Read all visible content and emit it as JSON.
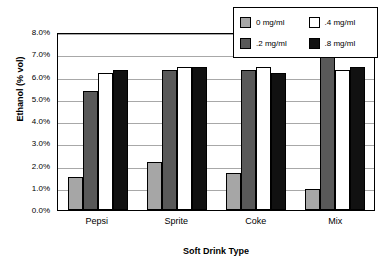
{
  "chart_data": {
    "type": "bar",
    "title": "",
    "xlabel": "Soft Drink Type",
    "ylabel": "Ethanol (% vol)",
    "categories": [
      "Pepsi",
      "Sprite",
      "Coke",
      "Mix"
    ],
    "series": [
      {
        "name": "0 mg/ml",
        "color": "#a6a6a6",
        "values": [
          1.5,
          2.15,
          1.65,
          0.95
        ]
      },
      {
        "name": ".2 mg/ml",
        "color": "#595959",
        "values": [
          5.35,
          6.3,
          6.3,
          7.0
        ]
      },
      {
        "name": ".4 mg/ml",
        "color": "#ffffff",
        "values": [
          6.15,
          6.45,
          6.45,
          6.3
        ]
      },
      {
        "name": ".8 mg/ml",
        "color": "#111111",
        "values": [
          6.3,
          6.45,
          6.15,
          6.45
        ]
      }
    ],
    "ylim": [
      0,
      8
    ],
    "ytick_labels": [
      "8.0%",
      "7.0%",
      "6.0%",
      "5.0%",
      "4.0%",
      "3.0%",
      "2.0%",
      "1.0%",
      "0.0%"
    ],
    "ytick_values": [
      8,
      7,
      6,
      5,
      4,
      3,
      2,
      1,
      0
    ],
    "grid": "horizontal",
    "legend_position": "top-right",
    "legend_order": [
      "0 mg/ml",
      ".4 mg/ml",
      ".2 mg/ml",
      ".8 mg/ml"
    ]
  }
}
